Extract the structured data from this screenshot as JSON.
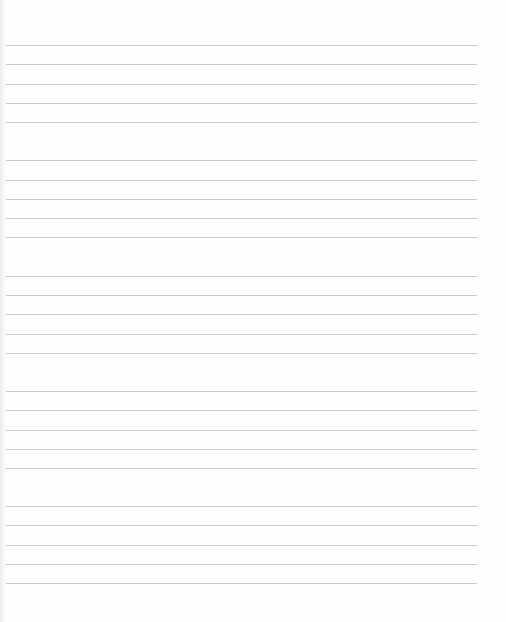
{
  "document": {
    "type": "lined-sheet",
    "line_color": "#c9c9c9",
    "background": "#fefefe",
    "line_left": 6,
    "line_right": 477,
    "groups": [
      {
        "lines": [
          45,
          64,
          84,
          103,
          122
        ]
      },
      {
        "lines": [
          160,
          180,
          199,
          218,
          237
        ]
      },
      {
        "lines": [
          276,
          295,
          314,
          334,
          353
        ]
      },
      {
        "lines": [
          391,
          410,
          430,
          449,
          468
        ]
      },
      {
        "lines": [
          506,
          525,
          545,
          564,
          583
        ]
      }
    ]
  }
}
